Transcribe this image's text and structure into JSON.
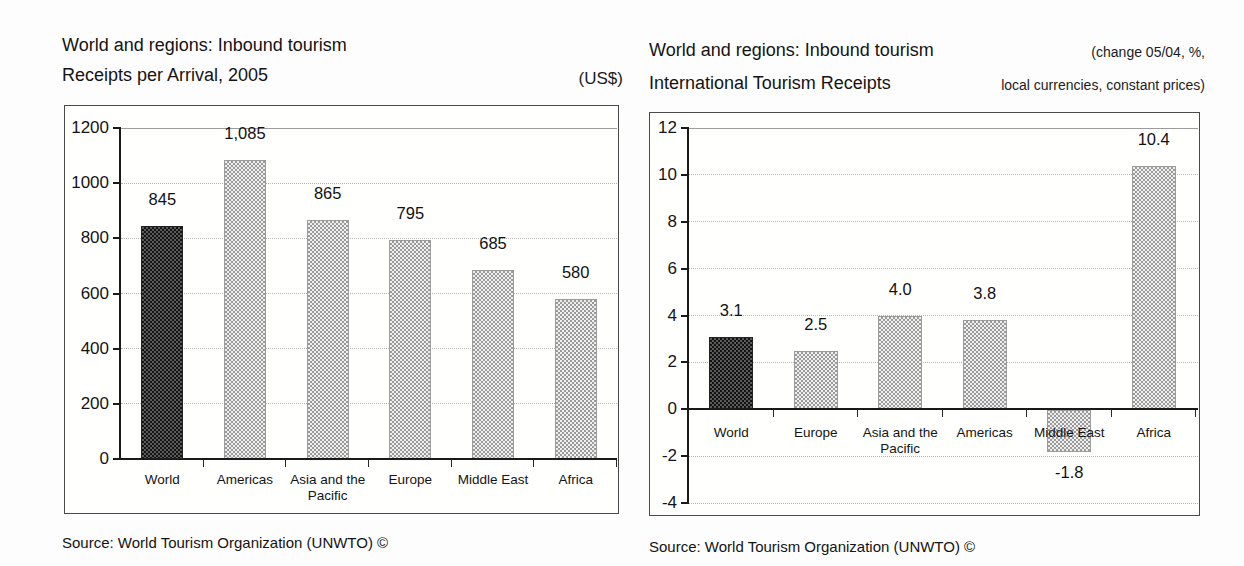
{
  "chart_data": [
    {
      "type": "bar",
      "title_line1": "World and regions: Inbound tourism",
      "title_line2": "Receipts per Arrival, 2005",
      "unit_line1": "",
      "unit_line2": "(US$)",
      "source": "Source: World Tourism Organization (UNWTO) ©",
      "categories": [
        "World",
        "Americas",
        "Asia and the Pacific",
        "Europe",
        "Middle East",
        "Africa"
      ],
      "values": [
        845,
        1085,
        865,
        795,
        685,
        580
      ],
      "value_labels": [
        "845",
        "1,085",
        "865",
        "795",
        "685",
        "580"
      ],
      "xlabel": "",
      "ylabel": "",
      "ylim": [
        0,
        1200
      ],
      "yticks": [
        0,
        200,
        400,
        600,
        800,
        1000,
        1200
      ],
      "grid": "horizontal-dotted",
      "legend": "none",
      "bar_style": {
        "first_bar": "dark-hatch",
        "other_bars": "light-hatch"
      }
    },
    {
      "type": "bar",
      "title_line1": "World and regions: Inbound tourism",
      "title_line2": "International Tourism Receipts",
      "unit_line1": "(change 05/04, %,",
      "unit_line2": "local currencies, constant prices)",
      "source": "Source: World Tourism Organization (UNWTO) ©",
      "categories": [
        "World",
        "Europe",
        "Asia and the Pacific",
        "Americas",
        "Middle East",
        "Africa"
      ],
      "values": [
        3.1,
        2.5,
        4.0,
        3.8,
        -1.8,
        10.4
      ],
      "value_labels": [
        "3.1",
        "2.5",
        "4.0",
        "3.8",
        "-1.8",
        "10.4"
      ],
      "xlabel": "",
      "ylabel": "",
      "ylim": [
        -4,
        12
      ],
      "yticks": [
        -4,
        -2,
        0,
        2,
        4,
        6,
        8,
        10,
        12
      ],
      "grid": "horizontal-dotted",
      "legend": "none",
      "bar_style": {
        "first_bar": "dark-hatch",
        "other_bars": "light-hatch"
      }
    }
  ],
  "colors": {
    "bar_light_hatch": "#c8c8c8",
    "bar_dark_hatch": "#383838",
    "gridline": "#b4b4b4",
    "axis": "#1a1a1a",
    "frame_border": "#4a4a4a",
    "text": "#141414",
    "background": "#fdfdfd"
  }
}
